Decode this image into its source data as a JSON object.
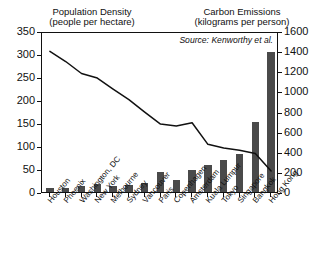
{
  "headers": {
    "left_title": "Population Density",
    "left_units": "(people per hectare)",
    "right_title": "Carbon Emissions",
    "right_units": "(kilograms per person)"
  },
  "annotation": {
    "source": "Source: Kenworthy et al."
  },
  "axes": {
    "left_ticks": [
      "0",
      "50",
      "100",
      "150",
      "200",
      "250",
      "300",
      "350"
    ],
    "right_ticks": [
      "0",
      "200",
      "400",
      "600",
      "800",
      "1000",
      "1200",
      "1400",
      "1600"
    ]
  },
  "chart_data": {
    "type": "bar",
    "title": "",
    "xlabel": "",
    "ylabel": "Population Density",
    "categories": [
      "Houston",
      "Phoenix",
      "Washington, DC",
      "New York",
      "Melbourne",
      "Sydney",
      "Vancouver",
      "Paris",
      "Copenhagen",
      "Amsterdam",
      "Kuala Lumpur",
      "Tokyo",
      "Singapore",
      "Bangkok",
      "Hong Kong"
    ],
    "series": [
      {
        "name": "Carbon Emissions",
        "type": "bar",
        "unit": "kilograms per person",
        "axis": "right",
        "ylim": [
          0,
          1600
        ],
        "values": [
          40,
          42,
          55,
          80,
          55,
          65,
          90,
          200,
          120,
          215,
          265,
          320,
          375,
          700,
          1390
        ]
      },
      {
        "name": "Population Density",
        "type": "line",
        "unit": "people per hectare",
        "axis": "left",
        "ylim": [
          0,
          350
        ],
        "values": [
          310,
          288,
          262,
          252,
          228,
          205,
          178,
          152,
          148,
          155,
          108,
          100,
          95,
          88,
          50
        ]
      }
    ],
    "grid": false,
    "legend": "none"
  },
  "colors": {
    "bar": "#4a4a4a",
    "line": "#111111",
    "axis": "#111111",
    "background": "#ffffff"
  }
}
